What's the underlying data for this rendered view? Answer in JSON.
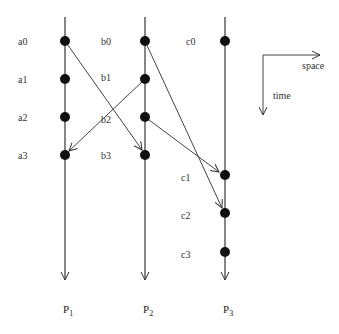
{
  "diagram": {
    "type": "space-time diagram",
    "axes": {
      "space_label": "space",
      "time_label": "time"
    },
    "processes": [
      {
        "id": "P1",
        "label": "P",
        "sub": "1",
        "x": 65
      },
      {
        "id": "P2",
        "label": "P",
        "sub": "2",
        "x": 145
      },
      {
        "id": "P3",
        "label": "P",
        "sub": "3",
        "x": 225
      }
    ],
    "events": [
      {
        "id": "a0",
        "label": "a0",
        "process": "P1",
        "y": 41
      },
      {
        "id": "a1",
        "label": "a1",
        "process": "P1",
        "y": 79
      },
      {
        "id": "a2",
        "label": "a2",
        "process": "P1",
        "y": 117
      },
      {
        "id": "a3",
        "label": "a3",
        "process": "P1",
        "y": 155
      },
      {
        "id": "b0",
        "label": "b0",
        "process": "P2",
        "y": 41
      },
      {
        "id": "b1",
        "label": "b1",
        "process": "P2",
        "y": 79
      },
      {
        "id": "b2",
        "label": "b2",
        "process": "P2",
        "y": 117
      },
      {
        "id": "b3",
        "label": "b3",
        "process": "P2",
        "y": 155
      },
      {
        "id": "c0",
        "label": "c0",
        "process": "P3",
        "y": 41
      },
      {
        "id": "c1",
        "label": "c1",
        "process": "P3",
        "y": 175
      },
      {
        "id": "c2",
        "label": "c2",
        "process": "P3",
        "y": 213
      },
      {
        "id": "c3",
        "label": "c3",
        "process": "P3",
        "y": 252
      }
    ],
    "messages": [
      {
        "from": "a0",
        "to": "b3"
      },
      {
        "from": "b1",
        "to": "a3"
      },
      {
        "from": "b0",
        "to": "c2"
      },
      {
        "from": "b2",
        "to": "c1"
      }
    ]
  }
}
